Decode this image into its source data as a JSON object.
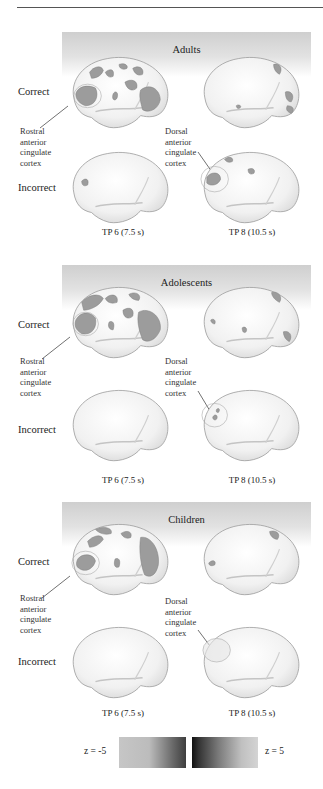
{
  "figure": {
    "groups": [
      {
        "title": "Adults",
        "rows": [
          "Correct",
          "Incorrect"
        ],
        "region_labels": {
          "left": [
            "Rostral",
            "anterior",
            "cingulate",
            "cortex"
          ],
          "right": [
            "Dorsal",
            "anterior",
            "cingulate",
            "cortex"
          ]
        },
        "timepoints": [
          "TP 6 (7.5 s)",
          "TP 8 (10.5 s)"
        ]
      },
      {
        "title": "Adolescents",
        "rows": [
          "Correct",
          "Incorrect"
        ],
        "region_labels": {
          "left": [
            "Rostral",
            "anterior",
            "cingulate",
            "cortex"
          ],
          "right": [
            "Dorsal",
            "anterior",
            "cingulate",
            "cortex"
          ]
        },
        "timepoints": [
          "TP 6 (7.5 s)",
          "TP 8 (10.5 s)"
        ]
      },
      {
        "title": "Children",
        "rows": [
          "Correct",
          "Incorrect"
        ],
        "region_labels": {
          "left": [
            "Rostral",
            "anterior",
            "cingulate",
            "cortex"
          ],
          "right": [
            "Dorsal",
            "anterior",
            "cingulate",
            "cortex"
          ]
        },
        "timepoints": [
          "TP 6 (7.5 s)",
          "TP 8 (10.5 s)"
        ]
      }
    ],
    "color_scale": {
      "min_label": "z = -5",
      "max_label": "z = 5"
    },
    "colors": {
      "band_top": "#cfcfcf",
      "brain_fill": "#f4f4f4",
      "brain_outline": "#9a9a9a",
      "activation": "#9c9c9c"
    }
  }
}
